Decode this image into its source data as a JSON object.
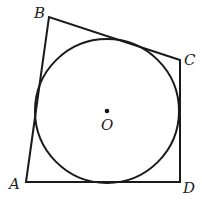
{
  "diagram": {
    "type": "geometry",
    "vertices": [
      {
        "name": "A",
        "x": 26,
        "y": 182,
        "label_x": 9,
        "label_y": 189
      },
      {
        "name": "B",
        "x": 49,
        "y": 17,
        "label_x": 34,
        "label_y": 17
      },
      {
        "name": "C",
        "x": 180,
        "y": 60,
        "label_x": 184,
        "label_y": 64
      },
      {
        "name": "D",
        "x": 180,
        "y": 182,
        "label_x": 183,
        "label_y": 192
      }
    ],
    "circle": {
      "center_label": "O",
      "cx": 107,
      "cy": 111,
      "r": 72
    },
    "stroke_color": "#1a1a1a"
  }
}
